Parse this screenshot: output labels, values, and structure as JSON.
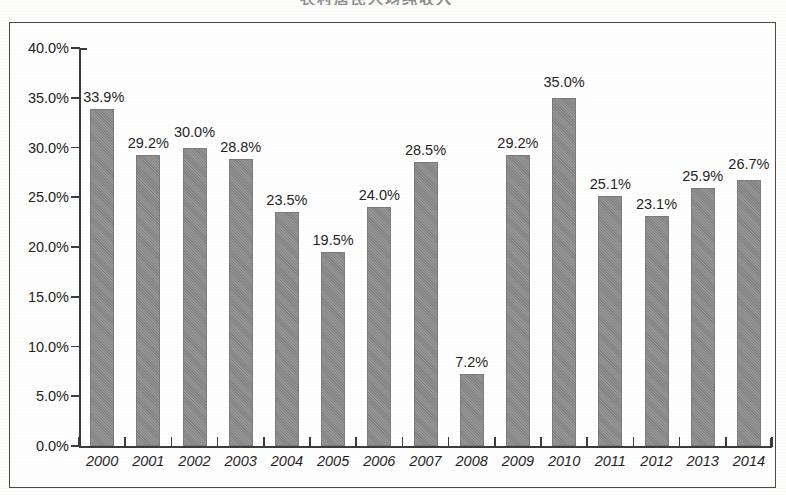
{
  "figure": {
    "clipped_title_fragment": "农村居民人均纯收入",
    "frame_border_color": "#4a4a4a",
    "bar_color": "#8a8a8a",
    "axis_color": "#3c3c3c",
    "text_color": "#1f1f1f"
  },
  "chart_data": {
    "type": "bar",
    "title": "",
    "xlabel": "",
    "ylabel": "",
    "ylim": [
      0,
      40
    ],
    "grid": false,
    "legend": null,
    "y_ticks": [
      "0.0%",
      "5.0%",
      "10.0%",
      "15.0%",
      "20.0%",
      "25.0%",
      "30.0%",
      "35.0%",
      "40.0%"
    ],
    "y_tick_values": [
      0,
      5,
      10,
      15,
      20,
      25,
      30,
      35,
      40
    ],
    "categories": [
      "2000",
      "2001",
      "2002",
      "2003",
      "2004",
      "2005",
      "2006",
      "2007",
      "2008",
      "2009",
      "2010",
      "2011",
      "2012",
      "2013",
      "2014"
    ],
    "values": [
      33.9,
      29.2,
      30.0,
      28.8,
      23.5,
      19.5,
      24.0,
      28.5,
      7.2,
      29.2,
      35.0,
      25.1,
      23.1,
      25.9,
      26.7
    ],
    "data_labels": [
      "33.9%",
      "29.2%",
      "30.0%",
      "28.8%",
      "23.5%",
      "19.5%",
      "24.0%",
      "28.5%",
      "7.2%",
      "29.2%",
      "35.0%",
      "25.1%",
      "23.1%",
      "25.9%",
      "26.7%"
    ]
  }
}
